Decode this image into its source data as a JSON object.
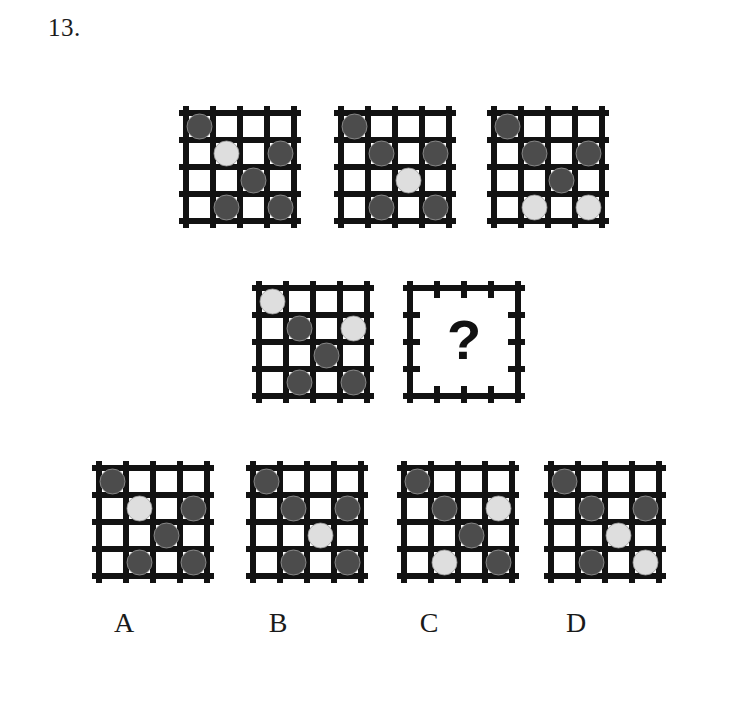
{
  "question": {
    "number": "13.",
    "type": "matrix-reasoning-puzzle"
  },
  "palette": {
    "background": "#ffffff",
    "grid_line": "#121212",
    "circle_dark": "#4c4c4c",
    "circle_light": "#dedede",
    "circle_outline": "#9a9a9a",
    "text": "#1a1a1a"
  },
  "grid_spec": {
    "rows": 4,
    "cols": 4,
    "cell_px": 27,
    "line_width_px": 6,
    "overhang_px": 7
  },
  "legend": {
    "dark": "dark-gray-circle",
    "light": "light-gray-circle",
    "empty": "empty-cell"
  },
  "matrix": {
    "top_row": [
      {
        "name": "matrix-cell-1",
        "x": 186,
        "y": 113,
        "circles": [
          {
            "row": 0,
            "col": 0,
            "tone": "dark"
          },
          {
            "row": 1,
            "col": 1,
            "tone": "light"
          },
          {
            "row": 1,
            "col": 3,
            "tone": "dark"
          },
          {
            "row": 2,
            "col": 2,
            "tone": "dark"
          },
          {
            "row": 3,
            "col": 1,
            "tone": "dark"
          },
          {
            "row": 3,
            "col": 3,
            "tone": "dark"
          }
        ]
      },
      {
        "name": "matrix-cell-2",
        "x": 341,
        "y": 113,
        "circles": [
          {
            "row": 0,
            "col": 0,
            "tone": "dark"
          },
          {
            "row": 1,
            "col": 1,
            "tone": "dark"
          },
          {
            "row": 1,
            "col": 3,
            "tone": "dark"
          },
          {
            "row": 2,
            "col": 2,
            "tone": "light"
          },
          {
            "row": 3,
            "col": 1,
            "tone": "dark"
          },
          {
            "row": 3,
            "col": 3,
            "tone": "dark"
          }
        ]
      },
      {
        "name": "matrix-cell-3",
        "x": 494,
        "y": 113,
        "circles": [
          {
            "row": 0,
            "col": 0,
            "tone": "dark"
          },
          {
            "row": 1,
            "col": 1,
            "tone": "dark"
          },
          {
            "row": 1,
            "col": 3,
            "tone": "dark"
          },
          {
            "row": 2,
            "col": 2,
            "tone": "dark"
          },
          {
            "row": 3,
            "col": 1,
            "tone": "light"
          },
          {
            "row": 3,
            "col": 3,
            "tone": "light"
          }
        ]
      }
    ],
    "bottom_row": [
      {
        "name": "matrix-cell-4",
        "x": 259,
        "y": 288,
        "circles": [
          {
            "row": 0,
            "col": 0,
            "tone": "light"
          },
          {
            "row": 1,
            "col": 1,
            "tone": "dark"
          },
          {
            "row": 1,
            "col": 3,
            "tone": "light"
          },
          {
            "row": 2,
            "col": 2,
            "tone": "dark"
          },
          {
            "row": 3,
            "col": 1,
            "tone": "dark"
          },
          {
            "row": 3,
            "col": 3,
            "tone": "dark"
          }
        ]
      }
    ],
    "missing_cell": {
      "name": "matrix-cell-missing",
      "x": 410,
      "y": 288,
      "symbol": "?"
    }
  },
  "options": [
    {
      "id": "A",
      "label": "A",
      "x": 99,
      "y": 468,
      "label_x": 124,
      "label_y": 607,
      "circles": [
        {
          "row": 0,
          "col": 0,
          "tone": "dark"
        },
        {
          "row": 1,
          "col": 1,
          "tone": "light"
        },
        {
          "row": 1,
          "col": 3,
          "tone": "dark"
        },
        {
          "row": 2,
          "col": 2,
          "tone": "dark"
        },
        {
          "row": 3,
          "col": 1,
          "tone": "dark"
        },
        {
          "row": 3,
          "col": 3,
          "tone": "dark"
        }
      ]
    },
    {
      "id": "B",
      "label": "B",
      "x": 253,
      "y": 468,
      "label_x": 278,
      "label_y": 607,
      "circles": [
        {
          "row": 0,
          "col": 0,
          "tone": "dark"
        },
        {
          "row": 1,
          "col": 1,
          "tone": "dark"
        },
        {
          "row": 1,
          "col": 3,
          "tone": "dark"
        },
        {
          "row": 2,
          "col": 2,
          "tone": "light"
        },
        {
          "row": 3,
          "col": 1,
          "tone": "dark"
        },
        {
          "row": 3,
          "col": 3,
          "tone": "dark"
        }
      ]
    },
    {
      "id": "C",
      "label": "C",
      "x": 404,
      "y": 468,
      "label_x": 429,
      "label_y": 607,
      "circles": [
        {
          "row": 0,
          "col": 0,
          "tone": "dark"
        },
        {
          "row": 1,
          "col": 1,
          "tone": "dark"
        },
        {
          "row": 1,
          "col": 3,
          "tone": "light"
        },
        {
          "row": 2,
          "col": 2,
          "tone": "dark"
        },
        {
          "row": 3,
          "col": 1,
          "tone": "light"
        },
        {
          "row": 3,
          "col": 3,
          "tone": "dark"
        }
      ]
    },
    {
      "id": "D",
      "label": "D",
      "x": 551,
      "y": 468,
      "label_x": 576,
      "label_y": 607,
      "circles": [
        {
          "row": 0,
          "col": 0,
          "tone": "dark"
        },
        {
          "row": 1,
          "col": 1,
          "tone": "dark"
        },
        {
          "row": 1,
          "col": 3,
          "tone": "dark"
        },
        {
          "row": 2,
          "col": 2,
          "tone": "light"
        },
        {
          "row": 3,
          "col": 1,
          "tone": "dark"
        },
        {
          "row": 3,
          "col": 3,
          "tone": "light"
        }
      ]
    }
  ]
}
